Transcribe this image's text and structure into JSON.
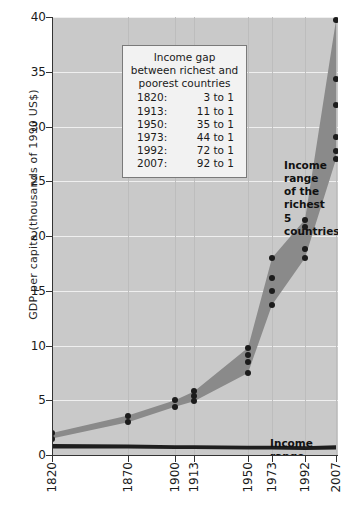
{
  "chart_data": {
    "type": "area",
    "title": "",
    "xlabel": "",
    "ylabel": "GDP per capita (thousands of 1990 US$)",
    "ylim": [
      0,
      40
    ],
    "yticks": [
      0,
      5,
      10,
      15,
      20,
      25,
      30,
      35,
      40
    ],
    "xticks": [
      "1820",
      "1870",
      "1900",
      "1913",
      "1950",
      "1973",
      "1992",
      "2007"
    ],
    "x": [
      1820,
      1870,
      1900,
      1913,
      1950,
      1973,
      1992,
      2007
    ],
    "grid": true,
    "legend_position": "inside-top-left",
    "series": [
      {
        "name": "Income range of the richest 5 countries",
        "kind": "band",
        "upper": [
          2.0,
          3.6,
          5.0,
          5.8,
          9.8,
          18.0,
          21.5,
          39.7
        ],
        "lower": [
          1.5,
          3.0,
          4.4,
          4.9,
          7.5,
          13.7,
          18.0,
          27.0
        ]
      },
      {
        "name": "Income range of the poorest countries",
        "kind": "band",
        "upper": [
          1.0,
          0.95,
          0.9,
          0.9,
          0.85,
          0.85,
          0.8,
          0.9
        ],
        "lower": [
          0.6,
          0.6,
          0.55,
          0.55,
          0.5,
          0.5,
          0.45,
          0.5
        ]
      }
    ],
    "points": [
      {
        "x": 1820,
        "values": [
          2.0,
          1.5
        ]
      },
      {
        "x": 1870,
        "values": [
          3.6,
          3.0
        ]
      },
      {
        "x": 1900,
        "values": [
          5.0,
          4.4
        ]
      },
      {
        "x": 1913,
        "values": [
          5.8,
          5.4,
          4.9
        ]
      },
      {
        "x": 1950,
        "values": [
          9.8,
          9.1,
          8.5,
          7.5
        ]
      },
      {
        "x": 1973,
        "values": [
          18.0,
          16.2,
          15.0,
          13.7
        ]
      },
      {
        "x": 1992,
        "values": [
          21.5,
          20.8,
          18.8,
          18.0
        ]
      },
      {
        "x": 2007,
        "values": [
          39.7,
          34.3,
          32.0,
          29.0,
          27.8,
          27.0
        ]
      }
    ],
    "colors": {
      "plot_background": "#c9c9c9",
      "band_richest": "#8a8a8a",
      "band_poorest": "#1e1e1e",
      "gridline": "#efefef",
      "marker": "#1c1c1c",
      "axis": "#333333"
    }
  },
  "legend_panel": {
    "title_line1": "Income gap",
    "title_line2": "between richest and",
    "title_line3": "poorest countries",
    "rows": [
      {
        "year": "1820:",
        "gap": "3 to 1"
      },
      {
        "year": "1913:",
        "gap": "11 to 1"
      },
      {
        "year": "1950:",
        "gap": "35 to 1"
      },
      {
        "year": "1973:",
        "gap": "44 to 1"
      },
      {
        "year": "1992:",
        "gap": "72 to 1"
      },
      {
        "year": "2007:",
        "gap": "92 to 1"
      }
    ]
  },
  "annotations": {
    "richest": "Income range\nof the richest\n5 countries",
    "poorest": "Income range\nof the poorest\ncountries"
  }
}
